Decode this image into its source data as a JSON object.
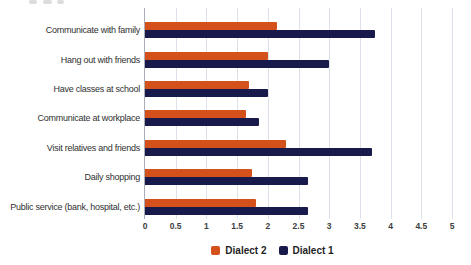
{
  "chart_data": {
    "type": "bar",
    "orientation": "horizontal",
    "categories": [
      "Communicate with family",
      "Hang out with friends",
      "Have classes at school",
      "Communicate at workplace",
      "Visit relatives and friends",
      "Daily shopping",
      "Public service (bank, hospital, etc.)"
    ],
    "series": [
      {
        "name": "Dialect 2",
        "color": "#d5511c",
        "values": [
          2.15,
          2.0,
          1.7,
          1.65,
          2.3,
          1.75,
          1.8
        ]
      },
      {
        "name": "Dialect 1",
        "color": "#171a4b",
        "values": [
          3.75,
          3.0,
          2.0,
          1.85,
          3.7,
          2.65,
          2.65
        ]
      }
    ],
    "xlim": [
      0,
      5
    ],
    "xticks": [
      0,
      0.5,
      1,
      1.5,
      2,
      2.5,
      3,
      3.5,
      4,
      4.5,
      5
    ],
    "xtick_labels": [
      "0",
      "0.5",
      "1",
      "1.5",
      "2",
      "2.5",
      "3",
      "3.5",
      "4",
      "4.5",
      "5"
    ],
    "grid": true,
    "legend_position": "bottom",
    "legend": [
      "Dialect 2",
      "Dialect 1"
    ]
  },
  "colors": {
    "background": "#ffffff",
    "gridline": "#dde1ea",
    "axis_line": "#abaeb6",
    "category_text": "#303030",
    "tick_text": "#3d3d3d",
    "legend_text": "#1f1f1f"
  }
}
